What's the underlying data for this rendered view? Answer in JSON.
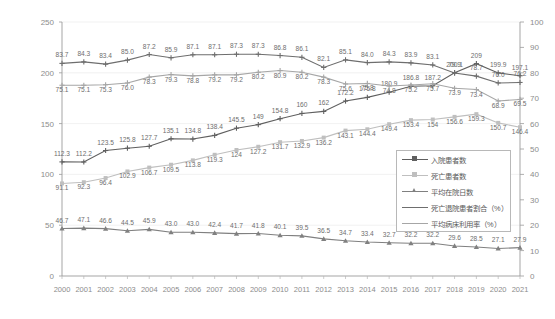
{
  "chart_data": {
    "type": "line",
    "title": "",
    "xlabel": "",
    "ylabel": "",
    "grid": true,
    "legend_position": "inside-bottom-right",
    "categories": [
      "2000",
      "2001",
      "2002",
      "2003",
      "2004",
      "2005",
      "2006",
      "2007",
      "2008",
      "2009",
      "2010",
      "2011",
      "2012",
      "2013",
      "2014",
      "2015",
      "2016",
      "2017",
      "2018",
      "2019",
      "2020",
      "2021"
    ],
    "ylim": [
      0,
      250
    ],
    "y2lim": [
      0,
      100
    ],
    "yticks": [
      0,
      50,
      100,
      150,
      200,
      250
    ],
    "y2ticks": [
      0,
      10,
      20,
      30,
      40,
      50,
      60,
      70,
      80,
      90,
      100
    ],
    "series": [
      {
        "name": "入院患者数",
        "axis": "left",
        "color": "#5f5f5f",
        "marker": "cross",
        "values": [
          112.3,
          112.2,
          123.5,
          125.8,
          127.7,
          135.1,
          134.8,
          138.4,
          145.5,
          149.0,
          154.8,
          160.0,
          162.0,
          172.2,
          175.8,
          180.9,
          186.8,
          187.2,
          200.1,
          209.0,
          199.9,
          197.1
        ]
      },
      {
        "name": "死亡患者数",
        "axis": "left",
        "color": "#bfbfbf",
        "marker": "square",
        "values": [
          91.1,
          92.3,
          96.4,
          102.9,
          106.7,
          109.5,
          113.8,
          119.3,
          124.0,
          127.2,
          131.7,
          132.9,
          136.2,
          143.1,
          144.4,
          149.4,
          153.4,
          154.0,
          156.6,
          159.3,
          150.7,
          146.4
        ]
      },
      {
        "name": "平均在院日数",
        "axis": "left",
        "color": "#808080",
        "marker": "triangle",
        "values": [
          46.7,
          47.1,
          46.6,
          44.5,
          45.9,
          43.0,
          43.0,
          42.4,
          41.7,
          41.8,
          40.1,
          39.5,
          36.5,
          34.7,
          33.4,
          32.7,
          32.2,
          32.2,
          29.6,
          28.5,
          27.1,
          27.9
        ]
      },
      {
        "name": "死亡退院患者割合（%）",
        "axis": "right",
        "color": "#6e6e6e",
        "marker": "cross",
        "values": [
          83.7,
          84.3,
          83.4,
          85.0,
          87.2,
          85.9,
          87.1,
          87.1,
          87.3,
          87.3,
          86.8,
          86.1,
          82.1,
          85.1,
          84.0,
          84.3,
          83.9,
          83.1,
          79.9,
          78.7,
          76.0,
          76.2
        ]
      },
      {
        "name": "平均病床利用率（%）",
        "axis": "right",
        "color": "#a6a6a6",
        "marker": "cross",
        "values": [
          75.1,
          75.1,
          75.3,
          76.0,
          78.3,
          79.3,
          78.8,
          79.2,
          79.2,
          80.2,
          80.9,
          80.2,
          78.3,
          75.6,
          75.8,
          74.8,
          75.2,
          75.7,
          73.9,
          73.4,
          68.9,
          69.5
        ]
      }
    ],
    "legend": [
      {
        "label": "入院患者数",
        "color": "#5f5f5f",
        "marker": "cross"
      },
      {
        "label": "死亡患者数",
        "color": "#bfbfbf",
        "marker": "square"
      },
      {
        "label": "平均在院日数",
        "color": "#808080",
        "marker": "triangle"
      },
      {
        "label": "死亡退院患者割合（%）",
        "color": "#6e6e6e",
        "marker": "none"
      },
      {
        "label": "平均病床利用率（%）",
        "color": "#a6a6a6",
        "marker": "none"
      }
    ]
  }
}
